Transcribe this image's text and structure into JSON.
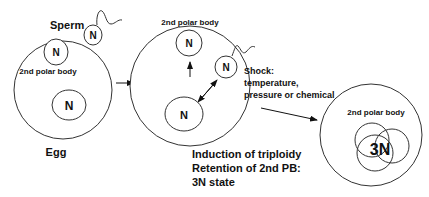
{
  "stage1": {
    "sperm_label": "Sperm",
    "sperm_nucleus": "N",
    "polar_body_nucleus": "N",
    "polar_body_label": "2nd polar body",
    "egg_nucleus": "N",
    "egg_label": "Egg"
  },
  "stage2": {
    "polar_body_label": "2nd polar body",
    "polar_body_nucleus": "N",
    "sperm_nucleus": "N",
    "egg_nucleus": "N",
    "shock_lines": [
      "Shock:",
      "temperature,",
      "pressure or chemical"
    ],
    "caption_lines": [
      "Induction of triploidy",
      "Retention of 2nd PB:",
      "3N state"
    ]
  },
  "stage3": {
    "polar_body_label": "2nd polar body",
    "nucleus_label": "3N"
  }
}
